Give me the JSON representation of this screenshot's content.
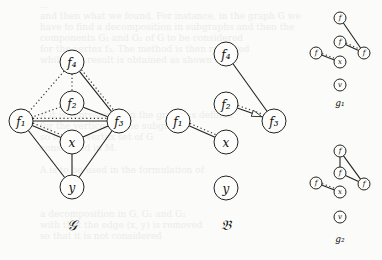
{
  "background_text": [
    "...",
    "and then what we found. For instance, in the graph G we",
    "have to find a decomposition in subgraphs and then the",
    "components G₁ and G₂ of G to be considered",
    "for the vertex f₃. The method is then repeated",
    "while this result is obtained as shown here.",
    "",
    "",
    "",
    "",
    "if it is represented in the graph as defined",
    "for the vertices of the subgraph",
    "so for the vertex set of G",
    "considered in M.",
    "",
    "A is to be used in the formulation of",
    "",
    "",
    "",
    "a decomposition in G, G₁ and G₂",
    "with that the edge (x, y) is removed",
    "so that it is not considered"
  ],
  "graphs": {
    "G": {
      "label": "𝒢",
      "nodes": [
        {
          "id": "f4",
          "label": "f₄",
          "x": 72,
          "y": 62,
          "r": 12
        },
        {
          "id": "f2",
          "label": "f₂",
          "x": 72,
          "y": 103,
          "r": 12
        },
        {
          "id": "f1",
          "label": "f₁",
          "x": 21,
          "y": 121,
          "r": 12
        },
        {
          "id": "f3",
          "label": "f₃",
          "x": 119,
          "y": 121,
          "r": 12
        },
        {
          "id": "x",
          "label": "x",
          "x": 72,
          "y": 142,
          "r": 12
        },
        {
          "id": "y",
          "label": "y",
          "x": 72,
          "y": 187,
          "r": 12
        }
      ],
      "label_pos": {
        "x": 72,
        "y": 230
      },
      "edges_solid": [
        [
          "f4",
          "f3"
        ],
        [
          "f2",
          "f3"
        ],
        [
          "f1",
          "f3"
        ],
        [
          "f1",
          "x"
        ],
        [
          "x",
          "f3"
        ],
        [
          "x",
          "y"
        ],
        [
          "f1",
          "y"
        ],
        [
          "f3",
          "y"
        ]
      ],
      "edges_dotted": [
        [
          "f4",
          "f1"
        ],
        [
          "f4",
          "f2"
        ],
        [
          "f2",
          "f1"
        ],
        [
          "f1",
          "f3"
        ],
        [
          "f1",
          "x"
        ],
        [
          "f4",
          "f3"
        ]
      ]
    },
    "B": {
      "label": "𝔅",
      "nodes": [
        {
          "id": "f4",
          "label": "f₄",
          "x": 226,
          "y": 54,
          "r": 12
        },
        {
          "id": "f2",
          "label": "f₂",
          "x": 226,
          "y": 104,
          "r": 12
        },
        {
          "id": "f3",
          "label": "f₃",
          "x": 274,
          "y": 121,
          "r": 12
        },
        {
          "id": "f1",
          "label": "f₁",
          "x": 178,
          "y": 121,
          "r": 12
        },
        {
          "id": "x",
          "label": "x",
          "x": 226,
          "y": 142,
          "r": 12
        },
        {
          "id": "y",
          "label": "y",
          "x": 226,
          "y": 188,
          "r": 12
        }
      ],
      "label_pos": {
        "x": 226,
        "y": 230
      },
      "edges_solid": [
        [
          "f4",
          "f3"
        ],
        [
          "f2",
          "f3"
        ],
        [
          "f1",
          "x"
        ]
      ],
      "edges_dotted": [
        [
          "f2",
          "f3"
        ],
        [
          "f1",
          "x"
        ]
      ],
      "arrow": {
        "from": "f2",
        "to": "f3"
      }
    },
    "g1": {
      "label": "g₁",
      "nodes": [
        {
          "id": "f4",
          "label": "f",
          "x": 340,
          "y": 18,
          "r": 6
        },
        {
          "id": "f2",
          "label": "f",
          "x": 340,
          "y": 42,
          "r": 6
        },
        {
          "id": "f3",
          "label": "f",
          "x": 364,
          "y": 53,
          "r": 6
        },
        {
          "id": "f1",
          "label": "f",
          "x": 316,
          "y": 53,
          "r": 6
        },
        {
          "id": "x",
          "label": "x",
          "x": 340,
          "y": 62,
          "r": 6
        },
        {
          "id": "y",
          "label": "v",
          "x": 340,
          "y": 85,
          "r": 6
        }
      ],
      "label_pos": {
        "x": 340,
        "y": 106
      },
      "edges_solid": [
        [
          "f4",
          "f3"
        ],
        [
          "f2",
          "f3"
        ],
        [
          "f1",
          "x"
        ]
      ],
      "edges_dotted": [
        [
          "f2",
          "f3"
        ],
        [
          "f1",
          "x"
        ]
      ]
    },
    "g2": {
      "label": "g₂",
      "nodes": [
        {
          "id": "f4",
          "label": "f",
          "x": 340,
          "y": 151,
          "r": 6
        },
        {
          "id": "f2",
          "label": "f",
          "x": 340,
          "y": 173,
          "r": 6
        },
        {
          "id": "f3",
          "label": "f",
          "x": 364,
          "y": 184,
          "r": 6
        },
        {
          "id": "f1",
          "label": "f",
          "x": 316,
          "y": 183,
          "r": 6
        },
        {
          "id": "x",
          "label": "x",
          "x": 340,
          "y": 192,
          "r": 6
        },
        {
          "id": "y",
          "label": "v",
          "x": 340,
          "y": 217,
          "r": 6
        }
      ],
      "label_pos": {
        "x": 340,
        "y": 242
      },
      "edges_solid": [
        [
          "f4",
          "f3"
        ],
        [
          "f4",
          "f2"
        ],
        [
          "f2",
          "f3"
        ],
        [
          "f1",
          "x"
        ]
      ],
      "edges_dotted": [
        [
          "f1",
          "x"
        ]
      ]
    }
  }
}
